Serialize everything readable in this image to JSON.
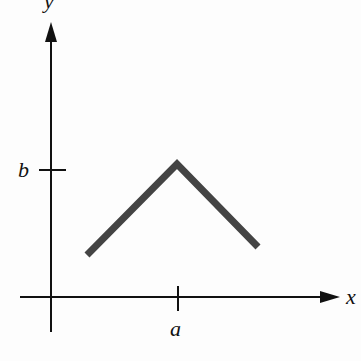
{
  "diagram": {
    "type": "piecewise-linear graph",
    "axes": {
      "x_label": "x",
      "y_label": "y",
      "x_tick_label": "a",
      "y_tick_label": "b"
    },
    "colors": {
      "axis": "#111111",
      "curve": "#444444",
      "background": "#fdfdfd"
    },
    "curve": {
      "description": "inverted V with peak at (a, b)",
      "points_px": [
        [
          87,
          257
        ],
        [
          177,
          163
        ],
        [
          258,
          248
        ]
      ]
    }
  }
}
